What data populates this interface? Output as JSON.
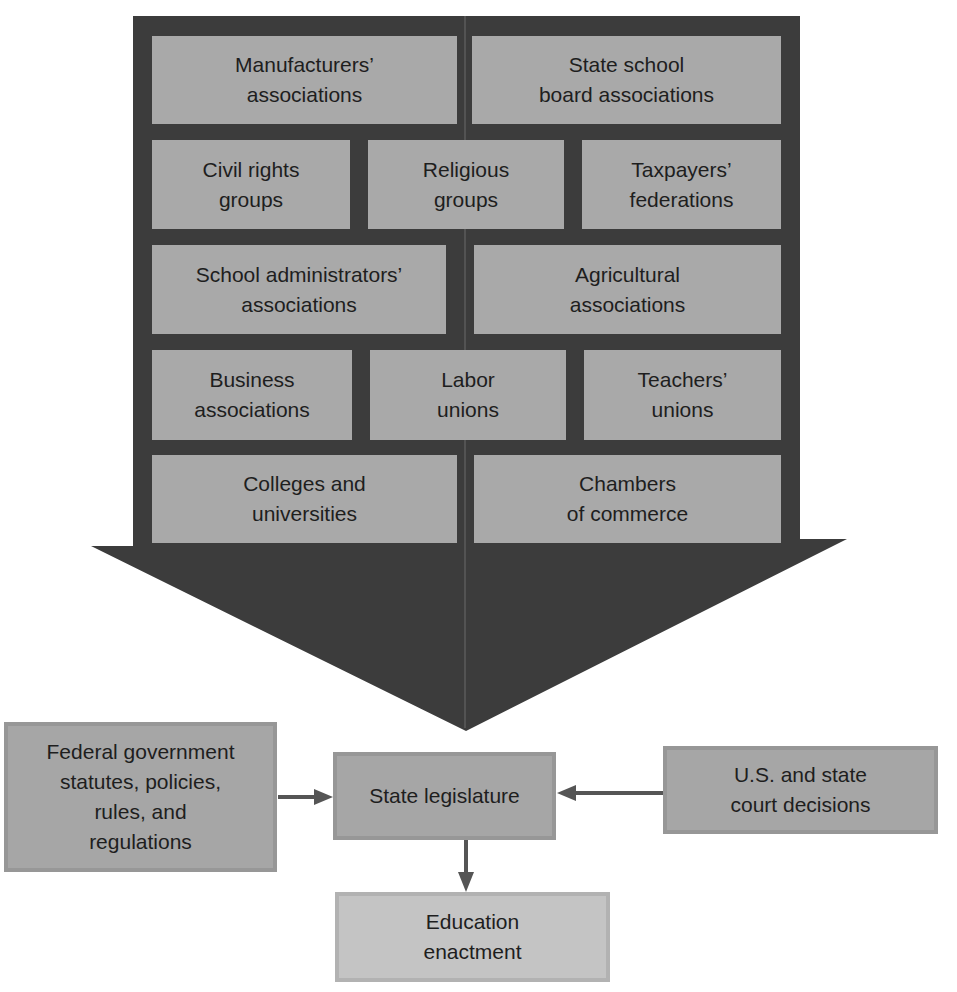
{
  "colors": {
    "frame": "#3c3c3c",
    "inner_box": "#a9a9a9",
    "flow_box": "#a6a6a6",
    "flow_box_border": "#979797",
    "result_box": "#c4c4c4",
    "connector": "#555555",
    "text": "#1e1e1e",
    "background": "#ffffff"
  },
  "influence_arrow": {
    "rows": [
      {
        "groups": [
          "Manufacturers’\nassociations",
          "State school\nboard associations"
        ]
      },
      {
        "groups": [
          "Civil rights\ngroups",
          "Religious\ngroups",
          "Taxpayers’\nfederations"
        ]
      },
      {
        "groups": [
          "School administrators’\nassociations",
          "Agricultural\nassociations"
        ]
      },
      {
        "groups": [
          "Business\nassociations",
          "Labor\nunions",
          "Teachers’\nunions"
        ]
      },
      {
        "groups": [
          "Colleges and\nuniversities",
          "Chambers\nof commerce"
        ]
      }
    ]
  },
  "flow": {
    "federal": "Federal government\nstatutes, policies,\nrules, and\nregulations",
    "legislature": "State legislature",
    "courts": "U.S. and state\ncourt decisions",
    "enactment": "Education\nenactment"
  }
}
